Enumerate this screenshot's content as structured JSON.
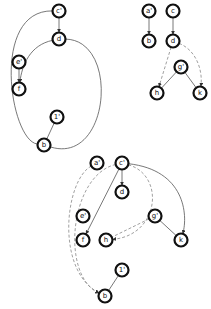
{
  "graphs": [
    {
      "id": "graph-1",
      "nodes": [
        {
          "id": "c1",
          "label": "c'"
        },
        {
          "id": "d",
          "label": "d"
        },
        {
          "id": "e1",
          "label": "e'"
        },
        {
          "id": "f",
          "label": "f"
        },
        {
          "id": "one1",
          "label": "1'"
        },
        {
          "id": "b",
          "label": "b"
        }
      ],
      "edges": [
        {
          "from": "c1",
          "to": "d",
          "style": "solid",
          "arrow": true
        },
        {
          "from": "e1",
          "to": "f",
          "style": "solid",
          "arrow": true
        },
        {
          "from": "d",
          "to": "f",
          "style": "solid",
          "arrow": true,
          "curve": "left"
        },
        {
          "from": "c1",
          "to": "b",
          "style": "solid",
          "arrow": false,
          "curve": "left-wide"
        },
        {
          "from": "d",
          "to": "b",
          "style": "solid",
          "arrow": false,
          "curve": "right-wide"
        },
        {
          "from": "one1",
          "to": "b",
          "style": "solid",
          "arrow": false
        }
      ]
    },
    {
      "id": "graph-2",
      "nodes": [
        {
          "id": "a1",
          "label": "a'"
        },
        {
          "id": "c",
          "label": "c"
        },
        {
          "id": "b",
          "label": "b"
        },
        {
          "id": "d",
          "label": "d"
        },
        {
          "id": "g1",
          "label": "g'"
        },
        {
          "id": "h",
          "label": "h"
        },
        {
          "id": "k",
          "label": "k"
        }
      ],
      "edges": [
        {
          "from": "a1",
          "to": "b",
          "style": "solid",
          "arrow": true
        },
        {
          "from": "c",
          "to": "d",
          "style": "solid",
          "arrow": true
        },
        {
          "from": "d",
          "to": "h",
          "style": "dashed",
          "arrow": true
        },
        {
          "from": "d",
          "to": "k",
          "style": "dashed",
          "arrow": true,
          "curve": "right"
        },
        {
          "from": "g1",
          "to": "h",
          "style": "solid",
          "arrow": false
        },
        {
          "from": "g1",
          "to": "k",
          "style": "solid",
          "arrow": false
        }
      ]
    },
    {
      "id": "graph-3",
      "nodes": [
        {
          "id": "a1",
          "label": "a'"
        },
        {
          "id": "c1",
          "label": "c'"
        },
        {
          "id": "d",
          "label": "d"
        },
        {
          "id": "e1",
          "label": "e'"
        },
        {
          "id": "g1",
          "label": "g'"
        },
        {
          "id": "f",
          "label": "f"
        },
        {
          "id": "h",
          "label": "h"
        },
        {
          "id": "k",
          "label": "k"
        },
        {
          "id": "one1",
          "label": "1'"
        },
        {
          "id": "b",
          "label": "b"
        }
      ],
      "edges": [
        {
          "from": "c1",
          "to": "d",
          "style": "solid",
          "arrow": true
        },
        {
          "from": "c1",
          "to": "f",
          "style": "solid",
          "arrow": true
        },
        {
          "from": "c1",
          "to": "h",
          "style": "dashed",
          "arrow": true,
          "curve": "right"
        },
        {
          "from": "c1",
          "to": "k",
          "style": "solid",
          "arrow": true,
          "curve": "right"
        },
        {
          "from": "g1",
          "to": "h",
          "style": "dashed",
          "arrow": false
        },
        {
          "from": "g1",
          "to": "k",
          "style": "solid",
          "arrow": false
        },
        {
          "from": "a1",
          "to": "b",
          "style": "dashed",
          "arrow": true,
          "curve": "left"
        },
        {
          "from": "c1",
          "to": "b",
          "style": "dashed",
          "arrow": true,
          "curve": "left-wide"
        },
        {
          "from": "one1",
          "to": "b",
          "style": "solid",
          "arrow": false
        }
      ]
    }
  ]
}
